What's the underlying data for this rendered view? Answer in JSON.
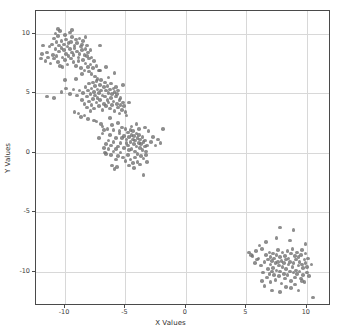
{
  "chart_data": {
    "type": "scatter",
    "title": "",
    "xlabel": "X Values",
    "ylabel": "Y Values",
    "xlim": [
      -12.4,
      12.0
    ],
    "ylim": [
      -12.9,
      11.9
    ],
    "xticks": [
      -10,
      -5,
      0,
      5,
      10
    ],
    "yticks": [
      10,
      5,
      0,
      -5,
      -10
    ],
    "xticklabels": [
      "-10",
      "-5",
      "0",
      "5",
      "10"
    ],
    "yticklabels": [
      "10",
      "5",
      "0",
      "-5",
      "-10"
    ],
    "grid": true,
    "legend": "none",
    "marker_color": "#6e6e6e",
    "marker_alpha": 0.78,
    "marker_size": 3.6,
    "n_points": 400,
    "clusters": [
      {
        "name": "cluster-1",
        "center": [
          -9.7,
          8.5
        ],
        "n": 100
      },
      {
        "name": "cluster-2",
        "center": [
          -7.0,
          4.8
        ],
        "n": 100
      },
      {
        "name": "cluster-3",
        "center": [
          -4.8,
          0.7
        ],
        "n": 100
      },
      {
        "name": "cluster-4",
        "center": [
          8.0,
          -9.2
        ],
        "n": 100
      }
    ],
    "points": [
      [
        -11.6,
        7.7
      ],
      [
        -11.5,
        8.4
      ],
      [
        -11.3,
        8.9
      ],
      [
        -11.2,
        7.5
      ],
      [
        -11.1,
        9.1
      ],
      [
        -11.0,
        8.2
      ],
      [
        -10.9,
        9.6
      ],
      [
        -10.9,
        7.9
      ],
      [
        -10.8,
        8.7
      ],
      [
        -10.8,
        10.0
      ],
      [
        -10.7,
        9.3
      ],
      [
        -10.7,
        8.1
      ],
      [
        -10.6,
        7.6
      ],
      [
        -10.6,
        9.8
      ],
      [
        -10.5,
        8.5
      ],
      [
        -10.5,
        9.0
      ],
      [
        -10.4,
        7.3
      ],
      [
        -10.4,
        10.2
      ],
      [
        -10.3,
        8.8
      ],
      [
        -10.3,
        9.4
      ],
      [
        -10.2,
        8.0
      ],
      [
        -10.2,
        7.2
      ],
      [
        -10.1,
        9.1
      ],
      [
        -10.1,
        8.6
      ],
      [
        -10.0,
        9.9
      ],
      [
        -10.0,
        7.8
      ],
      [
        -9.9,
        8.3
      ],
      [
        -9.9,
        9.5
      ],
      [
        -9.8,
        8.9
      ],
      [
        -9.8,
        7.4
      ],
      [
        -9.7,
        9.2
      ],
      [
        -9.7,
        8.1
      ],
      [
        -9.6,
        10.1
      ],
      [
        -9.6,
        8.7
      ],
      [
        -9.5,
        7.9
      ],
      [
        -9.5,
        9.3
      ],
      [
        -9.4,
        8.4
      ],
      [
        -9.4,
        9.7
      ],
      [
        -9.3,
        8.2
      ],
      [
        -9.3,
        7.6
      ],
      [
        -9.2,
        9.0
      ],
      [
        -9.2,
        8.8
      ],
      [
        -9.1,
        9.5
      ],
      [
        -9.1,
        7.3
      ],
      [
        -9.0,
        8.5
      ],
      [
        -9.0,
        9.2
      ],
      [
        -8.9,
        8.0
      ],
      [
        -8.9,
        7.7
      ],
      [
        -8.8,
        9.6
      ],
      [
        -8.8,
        8.3
      ],
      [
        -8.7,
        8.9
      ],
      [
        -8.7,
        7.1
      ],
      [
        -8.6,
        9.1
      ],
      [
        -8.6,
        8.6
      ],
      [
        -8.5,
        7.8
      ],
      [
        -8.5,
        9.4
      ],
      [
        -8.4,
        8.2
      ],
      [
        -8.4,
        6.9
      ],
      [
        -8.3,
        8.7
      ],
      [
        -8.3,
        7.5
      ],
      [
        -8.2,
        9.0
      ],
      [
        -8.2,
        8.1
      ],
      [
        -8.1,
        7.2
      ],
      [
        -8.1,
        8.4
      ],
      [
        -8.0,
        6.8
      ],
      [
        -8.0,
        7.9
      ],
      [
        -7.9,
        8.6
      ],
      [
        -7.9,
        7.4
      ],
      [
        -7.8,
        6.6
      ],
      [
        -7.8,
        8.0
      ],
      [
        -7.7,
        7.1
      ],
      [
        -7.6,
        7.7
      ],
      [
        -7.5,
        6.4
      ],
      [
        -7.4,
        7.3
      ],
      [
        -7.3,
        6.2
      ],
      [
        -7.2,
        6.9
      ],
      [
        -11.9,
        8.3
      ],
      [
        -11.8,
        9.0
      ],
      [
        -12.0,
        7.9
      ],
      [
        -10.6,
        10.4
      ],
      [
        -9.4,
        10.3
      ],
      [
        -8.3,
        9.7
      ],
      [
        -11.4,
        8.0
      ],
      [
        -10.0,
        6.1
      ],
      [
        -11.5,
        4.7
      ],
      [
        -10.3,
        5.1
      ],
      [
        -9.9,
        5.4
      ],
      [
        -9.6,
        4.9
      ],
      [
        -9.2,
        3.4
      ],
      [
        -10.9,
        4.6
      ],
      [
        -8.8,
        5.2
      ],
      [
        -7.0,
        2.4
      ],
      [
        -6.3,
        2.9
      ],
      [
        -6.9,
        2.2
      ],
      [
        -7.6,
        2.7
      ],
      [
        -8.4,
        3.1
      ],
      [
        -9.1,
        6.2
      ],
      [
        -8.6,
        6.6
      ],
      [
        -7.1,
        9.0
      ],
      [
        -6.6,
        7.2
      ],
      [
        -8.6,
        4.4
      ],
      [
        -8.5,
        5.0
      ],
      [
        -8.4,
        4.1
      ],
      [
        -8.3,
        5.5
      ],
      [
        -8.2,
        3.8
      ],
      [
        -8.2,
        4.7
      ],
      [
        -8.1,
        5.2
      ],
      [
        -8.0,
        4.3
      ],
      [
        -8.0,
        5.8
      ],
      [
        -7.9,
        3.5
      ],
      [
        -7.9,
        4.9
      ],
      [
        -7.8,
        5.4
      ],
      [
        -7.8,
        4.0
      ],
      [
        -7.7,
        5.9
      ],
      [
        -7.7,
        4.5
      ],
      [
        -7.6,
        5.1
      ],
      [
        -7.6,
        3.7
      ],
      [
        -7.5,
        4.8
      ],
      [
        -7.5,
        5.6
      ],
      [
        -7.4,
        4.2
      ],
      [
        -7.4,
        6.0
      ],
      [
        -7.3,
        5.3
      ],
      [
        -7.3,
        4.6
      ],
      [
        -7.2,
        3.9
      ],
      [
        -7.2,
        5.0
      ],
      [
        -7.1,
        5.7
      ],
      [
        -7.1,
        4.4
      ],
      [
        -7.0,
        5.2
      ],
      [
        -7.0,
        6.1
      ],
      [
        -6.9,
        4.8
      ],
      [
        -6.9,
        3.6
      ],
      [
        -6.8,
        5.5
      ],
      [
        -6.8,
        4.1
      ],
      [
        -6.7,
        5.9
      ],
      [
        -6.7,
        4.7
      ],
      [
        -6.6,
        5.2
      ],
      [
        -6.6,
        3.9
      ],
      [
        -6.5,
        4.4
      ],
      [
        -6.5,
        5.6
      ],
      [
        -6.4,
        5.0
      ],
      [
        -6.4,
        4.2
      ],
      [
        -6.3,
        5.3
      ],
      [
        -6.3,
        3.7
      ],
      [
        -6.2,
        4.6
      ],
      [
        -6.2,
        5.8
      ],
      [
        -6.1,
        4.9
      ],
      [
        -6.1,
        4.0
      ],
      [
        -6.0,
        5.4
      ],
      [
        -6.0,
        4.3
      ],
      [
        -5.9,
        5.1
      ],
      [
        -5.9,
        3.5
      ],
      [
        -5.8,
        4.7
      ],
      [
        -5.8,
        5.5
      ],
      [
        -5.7,
        4.1
      ],
      [
        -5.7,
        4.9
      ],
      [
        -5.6,
        3.8
      ],
      [
        -5.6,
        5.2
      ],
      [
        -5.5,
        4.4
      ],
      [
        -5.5,
        3.3
      ],
      [
        -5.4,
        4.0
      ],
      [
        -5.4,
        4.6
      ],
      [
        -5.3,
        3.6
      ],
      [
        -5.2,
        4.2
      ],
      [
        -5.1,
        3.9
      ],
      [
        -5.0,
        3.4
      ],
      [
        -9.0,
        4.8
      ],
      [
        -9.3,
        5.3
      ],
      [
        -8.9,
        3.3
      ],
      [
        -8.7,
        3.0
      ],
      [
        -4.7,
        4.2
      ],
      [
        -5.9,
        6.7
      ],
      [
        -6.4,
        6.3
      ],
      [
        -7.1,
        6.9
      ],
      [
        -5.2,
        5.7
      ],
      [
        -4.9,
        3.1
      ],
      [
        -8.1,
        2.8
      ],
      [
        -7.4,
        2.6
      ],
      [
        -6.1,
        2.3
      ],
      [
        -5.6,
        2.5
      ],
      [
        -6.8,
        1.9
      ],
      [
        -6.3,
        1.5
      ],
      [
        -5.8,
        1.2
      ],
      [
        -5.5,
        1.8
      ],
      [
        -5.3,
        2.1
      ],
      [
        -5.1,
        1.4
      ],
      [
        -5.0,
        2.0
      ],
      [
        -4.9,
        1.1
      ],
      [
        -4.8,
        1.7
      ],
      [
        -4.8,
        0.6
      ],
      [
        -4.7,
        1.3
      ],
      [
        -4.7,
        0.2
      ],
      [
        -4.6,
        1.9
      ],
      [
        -4.6,
        0.9
      ],
      [
        -4.5,
        1.5
      ],
      [
        -4.5,
        0.3
      ],
      [
        -4.4,
        1.1
      ],
      [
        -4.4,
        1.8
      ],
      [
        -4.3,
        0.7
      ],
      [
        -4.3,
        1.4
      ],
      [
        -4.2,
        0.1
      ],
      [
        -4.2,
        1.0
      ],
      [
        -4.1,
        1.6
      ],
      [
        -4.1,
        0.5
      ],
      [
        -4.0,
        1.2
      ],
      [
        -4.0,
        -0.1
      ],
      [
        -3.9,
        0.8
      ],
      [
        -3.9,
        1.5
      ],
      [
        -3.8,
        0.4
      ],
      [
        -3.8,
        1.1
      ],
      [
        -3.7,
        -0.3
      ],
      [
        -3.7,
        0.7
      ],
      [
        -3.6,
        1.3
      ],
      [
        -3.6,
        0.2
      ],
      [
        -3.5,
        0.9
      ],
      [
        -3.5,
        -0.5
      ],
      [
        -3.4,
        0.5
      ],
      [
        -3.4,
        1.0
      ],
      [
        -3.3,
        0.1
      ],
      [
        -3.3,
        -0.2
      ],
      [
        -3.2,
        0.6
      ],
      [
        -5.4,
        0.8
      ],
      [
        -5.4,
        0.0
      ],
      [
        -5.6,
        0.5
      ],
      [
        -5.6,
        -0.3
      ],
      [
        -5.8,
        0.3
      ],
      [
        -5.8,
        -0.6
      ],
      [
        -6.0,
        0.9
      ],
      [
        -6.0,
        0.1
      ],
      [
        -6.2,
        0.6
      ],
      [
        -6.2,
        -0.2
      ],
      [
        -6.4,
        1.0
      ],
      [
        -6.4,
        0.3
      ],
      [
        -6.6,
        0.7
      ],
      [
        -6.6,
        -0.1
      ],
      [
        -6.8,
        0.4
      ],
      [
        -5.2,
        -0.4
      ],
      [
        -5.0,
        -0.7
      ],
      [
        -4.8,
        -0.2
      ],
      [
        -4.6,
        -0.6
      ],
      [
        -4.4,
        -0.9
      ],
      [
        -4.2,
        -0.4
      ],
      [
        -4.0,
        -0.8
      ],
      [
        -3.8,
        -1.0
      ],
      [
        -5.1,
        0.4
      ],
      [
        -5.3,
        1.2
      ],
      [
        -5.5,
        1.6
      ],
      [
        -4.9,
        0.8
      ],
      [
        -4.7,
        -1.1
      ],
      [
        -4.3,
        -1.3
      ],
      [
        -5.9,
        -1.4
      ],
      [
        -6.1,
        -1.1
      ],
      [
        -5.7,
        -1.2
      ],
      [
        -3.5,
        -1.9
      ],
      [
        -3.1,
        1.8
      ],
      [
        -2.9,
        0.9
      ],
      [
        -2.7,
        1.3
      ],
      [
        -2.5,
        0.6
      ],
      [
        -2.3,
        1.1
      ],
      [
        -2.1,
        0.8
      ],
      [
        -1.9,
        2.0
      ],
      [
        -6.9,
        1.6
      ],
      [
        -7.2,
        1.2
      ],
      [
        -6.5,
        2.0
      ],
      [
        -6.0,
        1.9
      ],
      [
        -4.5,
        2.2
      ],
      [
        -4.1,
        2.4
      ],
      [
        -3.9,
        2.0
      ],
      [
        -3.4,
        2.1
      ],
      [
        -3.2,
        -0.8
      ],
      [
        -6.7,
        0.0
      ],
      [
        5.2,
        -8.4
      ],
      [
        5.5,
        -8.7
      ],
      [
        5.8,
        -8.3
      ],
      [
        6.0,
        -8.9
      ],
      [
        6.2,
        -9.5
      ],
      [
        6.3,
        -8.1
      ],
      [
        6.4,
        -10.1
      ],
      [
        6.5,
        -9.2
      ],
      [
        6.6,
        -8.6
      ],
      [
        6.7,
        -10.5
      ],
      [
        6.8,
        -9.0
      ],
      [
        6.8,
        -9.8
      ],
      [
        6.9,
        -8.4
      ],
      [
        6.9,
        -10.2
      ],
      [
        7.0,
        -9.4
      ],
      [
        7.0,
        -8.8
      ],
      [
        7.1,
        -10.0
      ],
      [
        7.1,
        -9.1
      ],
      [
        7.2,
        -8.5
      ],
      [
        7.2,
        -9.7
      ],
      [
        7.3,
        -10.3
      ],
      [
        7.3,
        -8.9
      ],
      [
        7.4,
        -9.3
      ],
      [
        7.4,
        -10.7
      ],
      [
        7.5,
        -8.6
      ],
      [
        7.5,
        -9.9
      ],
      [
        7.6,
        -9.2
      ],
      [
        7.6,
        -8.2
      ],
      [
        7.7,
        -10.4
      ],
      [
        7.7,
        -9.5
      ],
      [
        7.8,
        -8.8
      ],
      [
        7.8,
        -10.0
      ],
      [
        7.9,
        -9.1
      ],
      [
        7.9,
        -11.0
      ],
      [
        8.0,
        -9.6
      ],
      [
        8.0,
        -8.4
      ],
      [
        8.1,
        -10.2
      ],
      [
        8.1,
        -9.3
      ],
      [
        8.2,
        -8.7
      ],
      [
        8.2,
        -10.6
      ],
      [
        8.3,
        -9.0
      ],
      [
        8.3,
        -9.8
      ],
      [
        8.4,
        -8.3
      ],
      [
        8.4,
        -10.3
      ],
      [
        8.5,
        -9.4
      ],
      [
        8.5,
        -8.9
      ],
      [
        8.6,
        -10.0
      ],
      [
        8.6,
        -9.2
      ],
      [
        8.7,
        -8.5
      ],
      [
        8.7,
        -10.8
      ],
      [
        8.8,
        -9.6
      ],
      [
        8.8,
        -8.1
      ],
      [
        8.9,
        -10.1
      ],
      [
        8.9,
        -9.3
      ],
      [
        9.0,
        -8.7
      ],
      [
        9.0,
        -10.5
      ],
      [
        9.1,
        -9.0
      ],
      [
        9.1,
        -9.9
      ],
      [
        9.2,
        -8.4
      ],
      [
        9.2,
        -10.2
      ],
      [
        9.3,
        -9.5
      ],
      [
        9.3,
        -8.8
      ],
      [
        9.4,
        -10.0
      ],
      [
        9.4,
        -9.2
      ],
      [
        9.5,
        -8.6
      ],
      [
        9.5,
        -10.6
      ],
      [
        9.6,
        -9.4
      ],
      [
        9.6,
        -8.2
      ],
      [
        9.7,
        -10.3
      ],
      [
        9.7,
        -9.7
      ],
      [
        9.8,
        -9.0
      ],
      [
        9.8,
        -10.9
      ],
      [
        9.9,
        -9.3
      ],
      [
        9.9,
        -8.5
      ],
      [
        10.0,
        -10.1
      ],
      [
        10.0,
        -9.6
      ],
      [
        7.8,
        -6.3
      ],
      [
        7.5,
        -7.2
      ],
      [
        8.6,
        -7.4
      ],
      [
        9.9,
        -7.7
      ],
      [
        5.4,
        -8.6
      ],
      [
        5.9,
        -9.0
      ],
      [
        6.1,
        -7.8
      ],
      [
        10.4,
        -9.4
      ],
      [
        10.2,
        -10.4
      ],
      [
        7.1,
        -11.6
      ],
      [
        7.8,
        -11.7
      ],
      [
        9.3,
        -11.6
      ],
      [
        10.5,
        -12.2
      ],
      [
        6.5,
        -11.2
      ],
      [
        8.3,
        -11.3
      ],
      [
        9.0,
        -11.1
      ],
      [
        6.3,
        -10.8
      ],
      [
        7.0,
        -10.9
      ],
      [
        8.7,
        -11.4
      ],
      [
        9.6,
        -10.8
      ],
      [
        10.1,
        -8.9
      ],
      [
        5.7,
        -9.3
      ],
      [
        6.6,
        -7.5
      ],
      [
        8.9,
        -6.5
      ]
    ]
  }
}
